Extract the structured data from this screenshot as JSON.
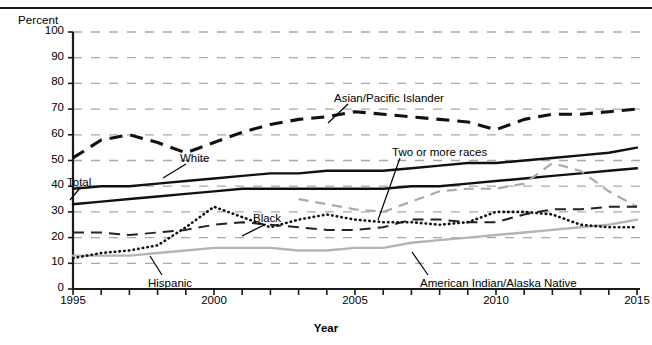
{
  "figure": {
    "y_axis_title": "Percent",
    "x_axis_title": "Year",
    "clipped_header_text": ""
  },
  "axes": {
    "y_ticks": [
      "0",
      "10",
      "20",
      "30",
      "40",
      "50",
      "60",
      "70",
      "80",
      "90",
      "100"
    ],
    "x_ticks": [
      "1995",
      "2000",
      "2005",
      "2010",
      "2015"
    ]
  },
  "series_labels": {
    "asian": "Asian/Pacific Islander",
    "white": "White",
    "total": "Total",
    "two_or_more": "Two or more races",
    "black": "Black",
    "hispanic": "Hispanic",
    "aian": "American Indian/Alaska Native"
  },
  "chart_data": {
    "type": "line",
    "title": "",
    "xlabel": "Year",
    "ylabel": "Percent",
    "xlim": [
      1995,
      2015
    ],
    "ylim": [
      0,
      100
    ],
    "ytick_step": 10,
    "grid": "horizontal-dashed",
    "legend": "inline-annotations",
    "x": [
      1995,
      1996,
      1997,
      1998,
      1999,
      2000,
      2001,
      2002,
      2003,
      2004,
      2005,
      2006,
      2007,
      2008,
      2009,
      2010,
      2011,
      2012,
      2013,
      2014,
      2015
    ],
    "series": [
      {
        "name": "Asian/Pacific Islander",
        "style": "bold-dashed-black",
        "color": "#111111",
        "values": [
          51,
          58,
          60,
          57,
          53,
          57,
          61,
          64,
          66,
          67,
          69,
          68,
          67,
          66,
          65,
          62,
          66,
          68,
          68,
          69,
          70
        ]
      },
      {
        "name": "White",
        "style": "solid-black",
        "color": "#111111",
        "values": [
          39,
          40,
          40,
          41,
          42,
          43,
          44,
          45,
          45,
          46,
          46,
          46,
          47,
          48,
          49,
          49,
          50,
          51,
          52,
          53,
          55
        ]
      },
      {
        "name": "Total",
        "style": "solid-black",
        "color": "#111111",
        "values": [
          33,
          34,
          35,
          36,
          37,
          38,
          39,
          39,
          39,
          39,
          39,
          39,
          40,
          40,
          41,
          42,
          43,
          44,
          45,
          46,
          47
        ]
      },
      {
        "name": "Two or more races",
        "style": "dashed-gray",
        "color": "#aaaaaa",
        "values": [
          null,
          null,
          null,
          null,
          null,
          null,
          null,
          null,
          35,
          33,
          31,
          30,
          34,
          38,
          39,
          39,
          41,
          49,
          46,
          38,
          32
        ]
      },
      {
        "name": "Black",
        "style": "long-dashed-black",
        "color": "#222222",
        "values": [
          22,
          22,
          21,
          22,
          23,
          25,
          26,
          25,
          24,
          23,
          23,
          24,
          27,
          27,
          26,
          26,
          29,
          31,
          31,
          32,
          32
        ]
      },
      {
        "name": "Hispanic",
        "style": "solid-gray",
        "color": "#b4b4b4",
        "values": [
          13,
          13,
          13,
          14,
          15,
          16,
          16,
          16,
          15,
          15,
          16,
          16,
          18,
          19,
          20,
          21,
          22,
          23,
          24,
          25,
          27
        ]
      },
      {
        "name": "American Indian/Alaska Native",
        "style": "dotted-black",
        "color": "#111111",
        "values": [
          12,
          14,
          15,
          17,
          24,
          32,
          28,
          24,
          27,
          29,
          27,
          26,
          26,
          25,
          26,
          30,
          30,
          29,
          25,
          24,
          24
        ]
      }
    ]
  }
}
